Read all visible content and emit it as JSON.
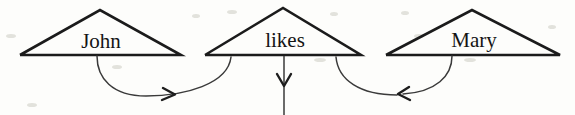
{
  "figure": {
    "type": "syntactic-tree-diagram",
    "background_color": "#fdfdfb",
    "stroke_color": "#1b1b1b",
    "link_color": "#3a3a3a",
    "width": 575,
    "height": 115
  },
  "nodes": [
    {
      "id": "john",
      "label": "John",
      "shape": "triangle",
      "apex": {
        "x": 100,
        "y": 10
      },
      "base_left": {
        "x": 20,
        "y": 55
      },
      "base_right": {
        "x": 181,
        "y": 55
      },
      "label_pos": {
        "x": 101,
        "y": 48
      }
    },
    {
      "id": "likes",
      "label": "likes",
      "shape": "triangle",
      "apex": {
        "x": 283,
        "y": 8
      },
      "base_left": {
        "x": 205,
        "y": 55
      },
      "base_right": {
        "x": 361,
        "y": 55
      },
      "label_pos": {
        "x": 285,
        "y": 47
      }
    },
    {
      "id": "mary",
      "label": "Mary",
      "shape": "triangle",
      "apex": {
        "x": 472,
        "y": 10
      },
      "base_left": {
        "x": 386,
        "y": 55
      },
      "base_right": {
        "x": 560,
        "y": 55
      },
      "label_pos": {
        "x": 474,
        "y": 47
      }
    }
  ],
  "links": [
    {
      "id": "john-to-likes",
      "from": "john",
      "to": "likes",
      "style": "curve",
      "direction": "rightward",
      "path": "M 97 56 C 97 78 112 96 146 96 C 185 96 228 84 231 57",
      "arrow": {
        "x": 170,
        "y": 94,
        "direction": "right"
      }
    },
    {
      "id": "likes-downward",
      "from": "likes",
      "to": "likes",
      "style": "straight-vertical",
      "direction": "downward",
      "path": "M 284 56 L 284 115",
      "arrow": {
        "x": 284,
        "y": 80,
        "direction": "down"
      }
    },
    {
      "id": "mary-to-likes",
      "from": "mary",
      "to": "likes",
      "style": "curve",
      "direction": "leftward",
      "path": "M 452 56 C 452 76 436 92 406 94",
      "arrow": {
        "x": 406,
        "y": 93,
        "direction": "left"
      }
    },
    {
      "id": "likes-right-branch",
      "from": "likes",
      "to": "mary",
      "style": "curve",
      "direction": "leftward",
      "path": "M 336 57 C 338 80 360 95 397 95",
      "arrow": {
        "x": 399,
        "y": 94,
        "direction": "left"
      }
    }
  ]
}
